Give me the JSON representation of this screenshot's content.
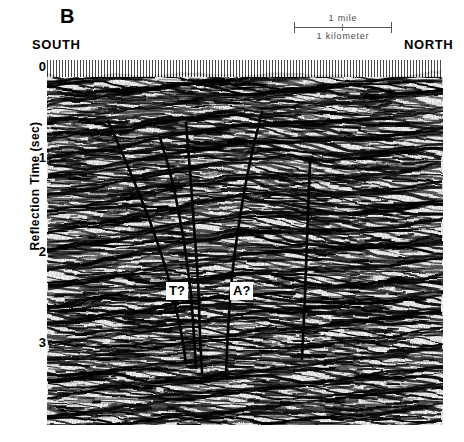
{
  "figure": {
    "panel_letter": "B",
    "direction_left": "SOUTH",
    "direction_right": "NORTH"
  },
  "scalebar": {
    "upper_label": "1 mile",
    "lower_label": "1 kilometer"
  },
  "axis": {
    "y_title": "Reflection Time (sec)",
    "y_ticks": [
      "0",
      "1",
      "2",
      "3"
    ]
  },
  "annotations": {
    "fault_t": "T?",
    "fault_a": "A?"
  },
  "chart_data": {
    "type": "line",
    "title": "",
    "subtitle": "",
    "xlabel": "",
    "ylabel": "Reflection Time (sec)",
    "ylim": [
      0,
      3.6
    ],
    "yticks": [
      0,
      1,
      2,
      3
    ],
    "grid": false,
    "legend_position": "none",
    "orientation": "south-to-north",
    "annotations": [
      {
        "label": "T?",
        "x_px": 168,
        "y_sec": 2.45
      },
      {
        "label": "A?",
        "x_px": 232,
        "y_sec": 2.45
      }
    ],
    "series": [
      {
        "name": "fault-1",
        "points": [
          [
            108,
            0.6
          ],
          [
            128,
            1.1
          ],
          [
            150,
            1.7
          ],
          [
            168,
            2.3
          ],
          [
            180,
            2.85
          ],
          [
            186,
            3.25
          ]
        ]
      },
      {
        "name": "fault-2",
        "points": [
          [
            160,
            0.78
          ],
          [
            172,
            1.25
          ],
          [
            182,
            1.8
          ],
          [
            190,
            2.4
          ],
          [
            194,
            2.95
          ],
          [
            196,
            3.3
          ]
        ]
      },
      {
        "name": "fault-3",
        "points": [
          [
            186,
            0.62
          ],
          [
            190,
            1.15
          ],
          [
            194,
            1.75
          ],
          [
            198,
            2.35
          ],
          [
            200,
            2.95
          ],
          [
            202,
            3.35
          ]
        ]
      },
      {
        "name": "fault-4",
        "points": [
          [
            262,
            0.5
          ],
          [
            250,
            1.05
          ],
          [
            240,
            1.65
          ],
          [
            232,
            2.3
          ],
          [
            228,
            2.9
          ],
          [
            226,
            3.4
          ]
        ]
      },
      {
        "name": "fault-5",
        "points": [
          [
            310,
            1.05
          ],
          [
            308,
            1.6
          ],
          [
            306,
            2.2
          ],
          [
            304,
            2.75
          ],
          [
            302,
            3.2
          ]
        ]
      }
    ]
  }
}
